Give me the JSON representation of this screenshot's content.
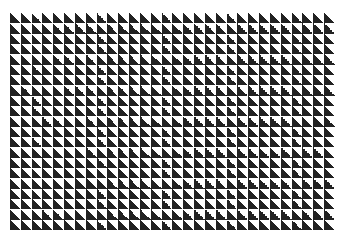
{
  "pattern": {
    "type": "triangle-grid",
    "columns": 30,
    "rows": 21,
    "triangle_orientation": "lower-left filled",
    "colors": {
      "dark": "#222222",
      "light": "#ffffff",
      "background": "#ffffff"
    }
  }
}
